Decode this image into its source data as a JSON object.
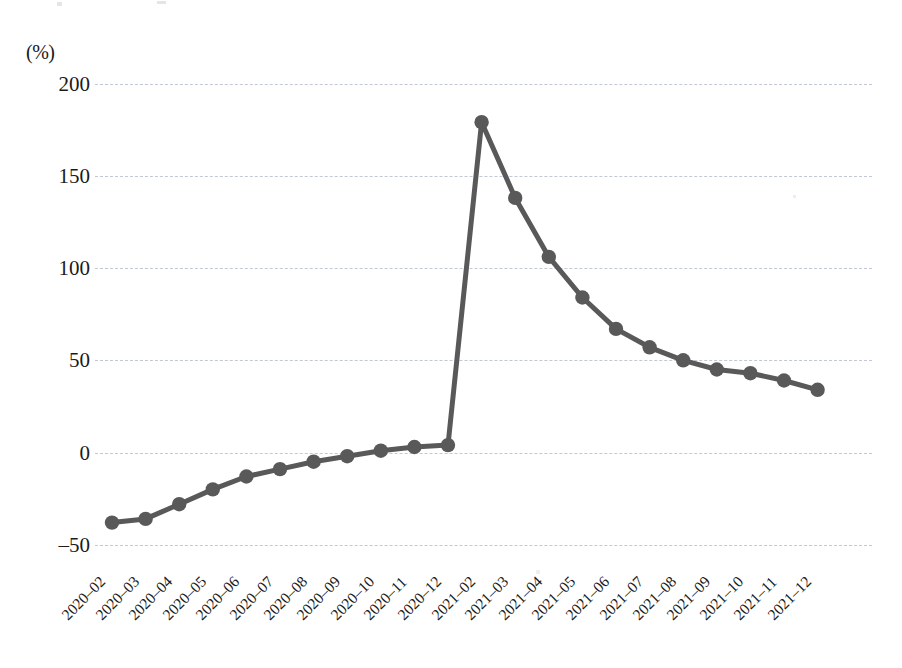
{
  "chart_data": {
    "type": "line",
    "title": "",
    "subtitle": "",
    "xlabel": "",
    "ylabel": "",
    "unit_label": "(%)",
    "ylim": [
      -50,
      200
    ],
    "yticks": [
      200,
      150,
      100,
      50,
      0,
      -50
    ],
    "ytick_labels": [
      "200",
      "150",
      "100",
      "50",
      "0",
      "–50"
    ],
    "grid": true,
    "legend": "none",
    "series_color": "#595959",
    "grid_color": "#b9bfd0",
    "categories": [
      "2020-02",
      "2020-03",
      "2020-04",
      "2020-05",
      "2020-06",
      "2020-07",
      "2020-08",
      "2020-09",
      "2020-10",
      "2020-11",
      "2020-12",
      "2021-02",
      "2021-03",
      "2021-04",
      "2021-05",
      "2021-06",
      "2021-07",
      "2021-08",
      "2021-09",
      "2021-10",
      "2021-11",
      "2021-12"
    ],
    "tick_labels": [
      "2020–02",
      "2020–03",
      "2020–04",
      "2020–05",
      "2020–06",
      "2020–07",
      "2020–08",
      "2020–09",
      "2020–10",
      "2020–11",
      "2020–12",
      "2021–02",
      "2021–03",
      "2021–04",
      "2021–05",
      "2021–06",
      "2021–07",
      "2021–08",
      "2021–09",
      "2021–10",
      "2021–11",
      "2021–12"
    ],
    "series": [
      {
        "name": "growth-rate",
        "values": [
          -38,
          -36,
          -28,
          -20,
          -13,
          -9,
          -5,
          -2,
          1,
          3,
          4,
          179,
          138,
          106,
          84,
          67,
          57,
          50,
          45,
          43,
          39,
          34
        ]
      }
    ]
  }
}
